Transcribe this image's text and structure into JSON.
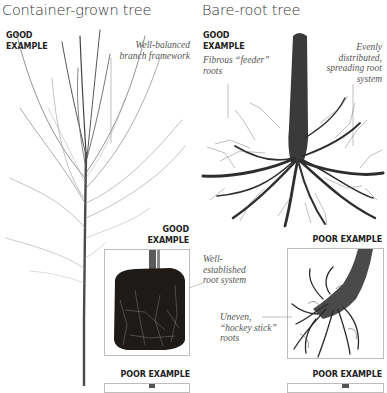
{
  "left_panel": {
    "title": "Container-grown tree",
    "top_tag": [
      "GOOD",
      "EXAMPLE"
    ],
    "branch_note": [
      "Well-balanced",
      "branch framework"
    ],
    "rootball_tag": [
      "GOOD",
      "EXAMPLE"
    ],
    "rootball_note": [
      "Well-",
      "established",
      "root system"
    ],
    "bottom_tag": "POOR EXAMPLE"
  },
  "right_panel": {
    "title": "Bare-root tree",
    "top_tag": [
      "GOOD",
      "EXAMPLE"
    ],
    "feeder_note": [
      "Fibrous “feeder”",
      "roots"
    ],
    "spread_note": [
      "Evenly",
      "distributed,",
      "spreading root",
      "system"
    ],
    "poor_tag_1": "POOR EXAMPLE",
    "hockey_note": [
      "Uneven,",
      "“hockey stick”",
      "roots"
    ],
    "poor_tag_2": "POOR EXAMPLE"
  },
  "colors": {
    "text": "#222222",
    "note": "#555555",
    "frame": "#bdbdbd",
    "bark": "#3a3a3a",
    "soil": "#1e1a18"
  }
}
